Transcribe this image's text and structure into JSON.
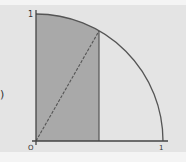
{
  "diagram": {
    "title": "",
    "labels": {
      "y_axis_one": "1",
      "origin": "O",
      "x_axis_one": "1",
      "left_fragment": ")"
    },
    "geometry": {
      "origin_px": [
        36,
        141
      ],
      "radius_px": 127,
      "point_on_arc_x_fraction": 0.5,
      "point_on_arc_px": [
        99,
        31
      ]
    },
    "elements": [
      "x-axis",
      "y-axis",
      "quarter-circle-arc",
      "shaded-rectangle",
      "diagonal-segment"
    ],
    "colors": {
      "background": "#e4e4e4",
      "shade": "#a9a9a9",
      "stroke": "#555555",
      "text": "#333333"
    }
  }
}
